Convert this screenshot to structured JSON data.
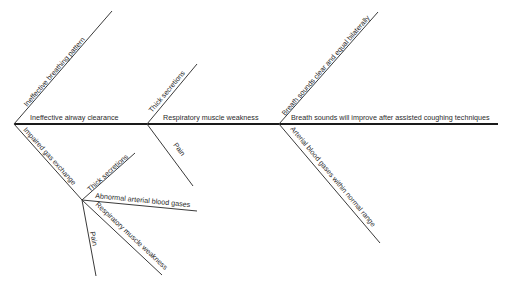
{
  "diagram": {
    "type": "fishbone",
    "spine": {
      "x1": 14,
      "y1": 124,
      "x2": 498,
      "y2": 124
    },
    "segments": [
      {
        "id": "seg1",
        "label": "Ineffective airway clearance",
        "label_x": 30,
        "label_y": 120
      },
      {
        "id": "seg2",
        "label": "Respiratory muscle weakness",
        "label_x": 163,
        "label_y": 120
      },
      {
        "id": "seg3",
        "label": "Breath sounds will improve after assisted coughing techniques",
        "label_x": 291,
        "label_y": 120
      }
    ],
    "bones": [
      {
        "id": "ineffective-breathing-pattern",
        "label": "Ineffective breathing pattern",
        "x1": 14,
        "y1": 124,
        "x2": 112,
        "y2": 11,
        "label_x": 27,
        "label_y": 107,
        "angle": -49
      },
      {
        "id": "impaired-gas-exchange",
        "label": "Impaired gas exchange",
        "x1": 14,
        "y1": 124,
        "x2": 82,
        "y2": 200,
        "label_x": 23,
        "label_y": 130,
        "angle": 48
      },
      {
        "id": "thick-secretions-upper",
        "label": "Thick secretions",
        "x1": 147,
        "y1": 124,
        "x2": 197,
        "y2": 64,
        "label_x": 152,
        "label_y": 113,
        "angle": -50
      },
      {
        "id": "pain-upper",
        "label": "Pain",
        "x1": 147,
        "y1": 124,
        "x2": 193,
        "y2": 186,
        "label_x": 173,
        "label_y": 145,
        "angle": 53
      },
      {
        "id": "breath-sounds-clear",
        "label": "Breath sounds clear and equal bilaterally",
        "x1": 279,
        "y1": 124,
        "x2": 378,
        "y2": 12,
        "label_x": 285,
        "label_y": 116,
        "angle": -49
      },
      {
        "id": "arterial-blood-gases-normal",
        "label": "Arterial blood gases within normal range",
        "x1": 279,
        "y1": 124,
        "x2": 380,
        "y2": 243,
        "label_x": 290,
        "label_y": 129,
        "angle": 50
      },
      {
        "id": "thick-secretions-lower",
        "label": "Thick secretions",
        "x1": 82,
        "y1": 200,
        "x2": 135,
        "y2": 153,
        "label_x": 90,
        "label_y": 192,
        "angle": -42
      },
      {
        "id": "abnormal-abg",
        "label": "Abnormal arterial blood gases",
        "x1": 82,
        "y1": 200,
        "x2": 197,
        "y2": 211,
        "label_x": 95,
        "label_y": 198,
        "angle": 5.5
      },
      {
        "id": "respiratory-muscle-weakness-lower",
        "label": "Respiratory muscle weakness",
        "x1": 82,
        "y1": 200,
        "x2": 162,
        "y2": 275,
        "label_x": 95,
        "label_y": 205,
        "angle": 43
      },
      {
        "id": "pain-lower",
        "label": "Pain",
        "x1": 82,
        "y1": 200,
        "x2": 96,
        "y2": 276,
        "label_x": 90,
        "label_y": 232,
        "angle": 79
      }
    ]
  }
}
